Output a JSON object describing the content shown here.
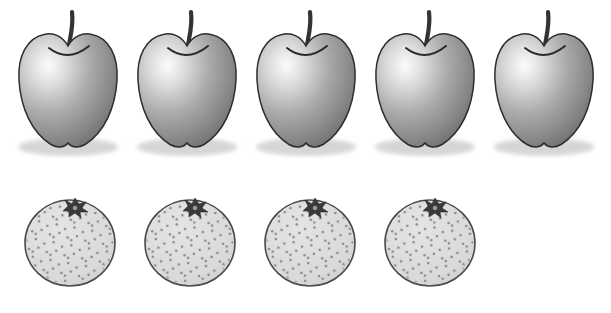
{
  "figure": {
    "type": "illustration",
    "rows": [
      {
        "id": "apples-row",
        "fruit": "apple",
        "count": 5
      },
      {
        "id": "oranges-row",
        "fruit": "orange",
        "count": 4
      }
    ],
    "colors": {
      "background": "#ffffff",
      "apple_highlight": "#fcfcfc",
      "apple_mid": "#ababab",
      "apple_shade": "#6a6a6a",
      "outline": "#2d2d2d",
      "stem": "#333333",
      "shadow": "#d6d6d6",
      "orange_fill": "#dedede",
      "orange_speckle": "#8a8a8a",
      "orange_outline": "#4a4a4a",
      "calyx": "#3a3a3a"
    }
  }
}
